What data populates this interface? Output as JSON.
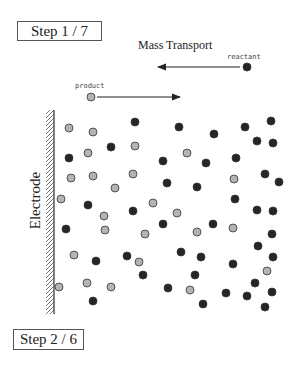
{
  "steps": {
    "top": "Step 1 / 7",
    "bottom": "Step 2 / 6"
  },
  "diagram": {
    "title": "Mass Transport",
    "electrode_label": "Electrode",
    "legend": {
      "reactant_label": "reactant",
      "product_label": "product"
    },
    "colors": {
      "reactant": "#262626",
      "product": "#b3b3b3",
      "outline": "#333333"
    },
    "particles": [
      {
        "x": 69,
        "y": 128,
        "type": "product"
      },
      {
        "x": 93,
        "y": 132,
        "type": "product"
      },
      {
        "x": 135,
        "y": 122,
        "type": "reactant"
      },
      {
        "x": 111,
        "y": 147,
        "type": "reactant"
      },
      {
        "x": 135,
        "y": 146,
        "type": "product"
      },
      {
        "x": 88,
        "y": 153,
        "type": "product"
      },
      {
        "x": 69,
        "y": 158,
        "type": "reactant"
      },
      {
        "x": 163,
        "y": 161,
        "type": "reactant"
      },
      {
        "x": 71,
        "y": 178,
        "type": "product"
      },
      {
        "x": 93,
        "y": 176,
        "type": "product"
      },
      {
        "x": 133,
        "y": 174,
        "type": "product"
      },
      {
        "x": 167,
        "y": 183,
        "type": "reactant"
      },
      {
        "x": 115,
        "y": 188,
        "type": "product"
      },
      {
        "x": 61,
        "y": 199,
        "type": "product"
      },
      {
        "x": 88,
        "y": 205,
        "type": "reactant"
      },
      {
        "x": 133,
        "y": 211,
        "type": "reactant"
      },
      {
        "x": 153,
        "y": 203,
        "type": "product"
      },
      {
        "x": 179,
        "y": 127,
        "type": "reactant"
      },
      {
        "x": 214,
        "y": 134,
        "type": "reactant"
      },
      {
        "x": 245,
        "y": 127,
        "type": "reactant"
      },
      {
        "x": 271,
        "y": 121,
        "type": "reactant"
      },
      {
        "x": 257,
        "y": 141,
        "type": "reactant"
      },
      {
        "x": 273,
        "y": 143,
        "type": "reactant"
      },
      {
        "x": 187,
        "y": 153,
        "type": "product"
      },
      {
        "x": 206,
        "y": 163,
        "type": "reactant"
      },
      {
        "x": 236,
        "y": 158,
        "type": "reactant"
      },
      {
        "x": 265,
        "y": 174,
        "type": "reactant"
      },
      {
        "x": 279,
        "y": 182,
        "type": "reactant"
      },
      {
        "x": 234,
        "y": 179,
        "type": "product"
      },
      {
        "x": 197,
        "y": 187,
        "type": "reactant"
      },
      {
        "x": 235,
        "y": 199,
        "type": "reactant"
      },
      {
        "x": 104,
        "y": 216,
        "type": "product"
      },
      {
        "x": 66,
        "y": 229,
        "type": "reactant"
      },
      {
        "x": 105,
        "y": 230,
        "type": "product"
      },
      {
        "x": 163,
        "y": 224,
        "type": "reactant"
      },
      {
        "x": 145,
        "y": 234,
        "type": "product"
      },
      {
        "x": 74,
        "y": 255,
        "type": "product"
      },
      {
        "x": 96,
        "y": 261,
        "type": "reactant"
      },
      {
        "x": 127,
        "y": 256,
        "type": "reactant"
      },
      {
        "x": 139,
        "y": 262,
        "type": "product"
      },
      {
        "x": 143,
        "y": 275,
        "type": "reactant"
      },
      {
        "x": 59,
        "y": 287,
        "type": "product"
      },
      {
        "x": 87,
        "y": 283,
        "type": "product"
      },
      {
        "x": 111,
        "y": 287,
        "type": "product"
      },
      {
        "x": 168,
        "y": 288,
        "type": "reactant"
      },
      {
        "x": 93,
        "y": 301,
        "type": "reactant"
      },
      {
        "x": 257,
        "y": 210,
        "type": "reactant"
      },
      {
        "x": 273,
        "y": 211,
        "type": "reactant"
      },
      {
        "x": 177,
        "y": 213,
        "type": "product"
      },
      {
        "x": 213,
        "y": 224,
        "type": "reactant"
      },
      {
        "x": 197,
        "y": 232,
        "type": "product"
      },
      {
        "x": 233,
        "y": 228,
        "type": "product"
      },
      {
        "x": 272,
        "y": 234,
        "type": "reactant"
      },
      {
        "x": 258,
        "y": 246,
        "type": "reactant"
      },
      {
        "x": 181,
        "y": 252,
        "type": "reactant"
      },
      {
        "x": 201,
        "y": 257,
        "type": "reactant"
      },
      {
        "x": 233,
        "y": 264,
        "type": "reactant"
      },
      {
        "x": 273,
        "y": 257,
        "type": "reactant"
      },
      {
        "x": 267,
        "y": 271,
        "type": "product"
      },
      {
        "x": 195,
        "y": 275,
        "type": "reactant"
      },
      {
        "x": 255,
        "y": 283,
        "type": "reactant"
      },
      {
        "x": 190,
        "y": 290,
        "type": "product"
      },
      {
        "x": 226,
        "y": 293,
        "type": "reactant"
      },
      {
        "x": 247,
        "y": 296,
        "type": "reactant"
      },
      {
        "x": 272,
        "y": 292,
        "type": "reactant"
      },
      {
        "x": 203,
        "y": 304,
        "type": "reactant"
      },
      {
        "x": 265,
        "y": 307,
        "type": "reactant"
      }
    ]
  }
}
